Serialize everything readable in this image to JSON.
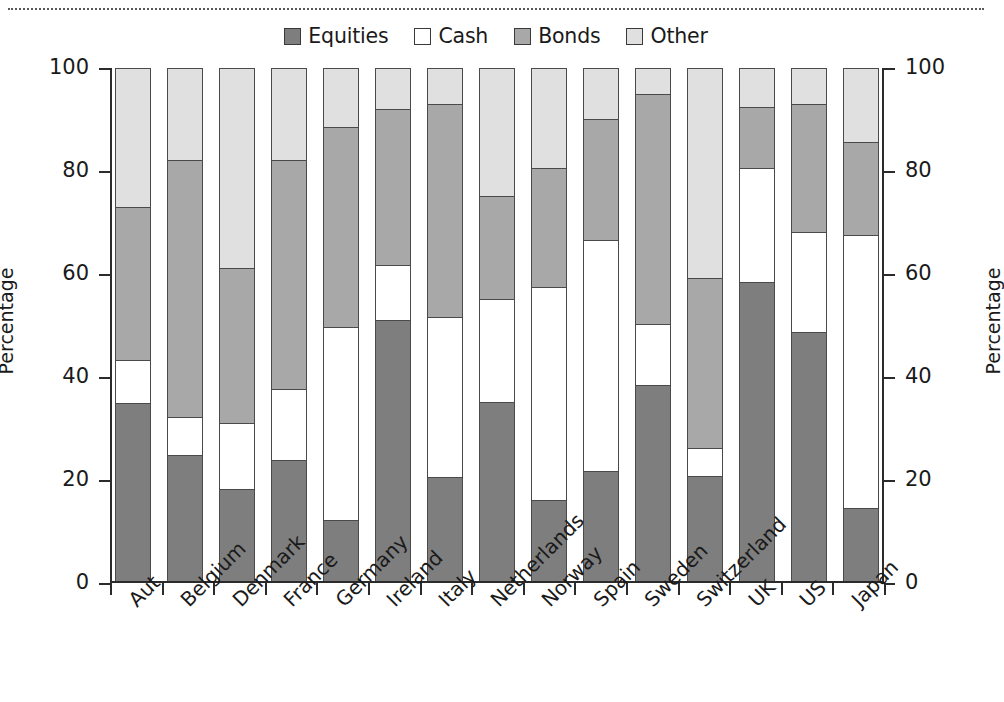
{
  "chart_data": {
    "type": "bar",
    "subtype": "stacked-bar-100-percent",
    "title": "",
    "xlabel": "",
    "ylabel": "Percentage",
    "ylabel_right": "Percentage",
    "ylim": [
      0,
      100
    ],
    "yticks": [
      0,
      20,
      40,
      60,
      80,
      100
    ],
    "ytick_labels": [
      "0",
      "20",
      "40",
      "60",
      "80",
      "100"
    ],
    "grid": false,
    "legend_position": "top-center",
    "categories": [
      "Aut",
      "Belgium",
      "Denmark",
      "France",
      "Germany",
      "Ireland",
      "Italy",
      "Netherlands",
      "Norway",
      "Spain",
      "Sweden",
      "Switzerland",
      "UK",
      "US",
      "Japan"
    ],
    "series": [
      {
        "name": "Equities",
        "color": "#7e7e7e",
        "values": [
          34.7,
          24.5,
          18.0,
          23.6,
          11.8,
          50.8,
          20.3,
          34.8,
          15.8,
          21.5,
          38.2,
          20.5,
          58.3,
          48.5,
          14.3
        ]
      },
      {
        "name": "Cash",
        "color": "#ffffff",
        "values": [
          8.3,
          7.5,
          12.9,
          13.9,
          37.7,
          10.9,
          31.2,
          20.1,
          41.5,
          45.0,
          12.0,
          5.4,
          22.2,
          19.6,
          53.2
        ]
      },
      {
        "name": "Bonds",
        "color": "#a8a8a8",
        "values": [
          30.0,
          50.0,
          30.1,
          44.5,
          39.0,
          30.3,
          41.5,
          20.1,
          23.2,
          23.5,
          44.8,
          33.1,
          12.0,
          24.9,
          18.0
        ]
      },
      {
        "name": "Other",
        "color": "#e0e0e0",
        "values": [
          27.0,
          18.0,
          39.0,
          18.0,
          11.5,
          8.0,
          7.0,
          25.0,
          19.5,
          10.0,
          5.0,
          41.0,
          7.5,
          7.0,
          14.5
        ]
      }
    ],
    "stack_tops": {
      "equities": [
        34.7,
        24.5,
        18.0,
        23.6,
        11.8,
        50.8,
        20.3,
        34.8,
        15.8,
        21.5,
        38.2,
        20.5,
        58.3,
        48.5,
        14.3
      ],
      "cash": [
        43.0,
        32.0,
        30.9,
        37.5,
        49.5,
        61.7,
        51.5,
        54.9,
        57.3,
        66.5,
        50.2,
        25.9,
        80.5,
        68.1,
        67.5
      ],
      "bonds": [
        73.0,
        82.0,
        61.0,
        82.0,
        88.5,
        92.0,
        93.0,
        75.0,
        80.5,
        90.0,
        95.0,
        59.0,
        92.5,
        93.0,
        85.5
      ],
      "other": [
        100,
        100,
        100,
        100,
        100,
        100,
        100,
        100,
        100,
        100,
        100,
        100,
        100,
        100,
        100
      ]
    }
  },
  "legend": {
    "items": [
      {
        "label": "Equities",
        "color": "#7e7e7e"
      },
      {
        "label": "Cash",
        "color": "#ffffff"
      },
      {
        "label": "Bonds",
        "color": "#a8a8a8"
      },
      {
        "label": "Other",
        "color": "#e0e0e0"
      }
    ]
  },
  "axes": {
    "left_title": "Percentage",
    "right_title": "Percentage",
    "tick_labels": [
      "100",
      "80",
      "60",
      "40",
      "20",
      "0"
    ]
  }
}
